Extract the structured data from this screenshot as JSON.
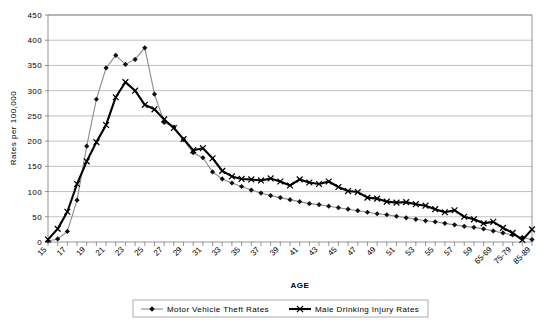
{
  "chart_data": {
    "type": "line",
    "title": "",
    "xlabel": "AGE",
    "ylabel": "Rates  per  100,000",
    "ylim": [
      0,
      450
    ],
    "ytick_step": 50,
    "yticks": [
      0,
      50,
      100,
      150,
      200,
      250,
      300,
      350,
      400,
      450
    ],
    "grid": true,
    "legend_position": "bottom",
    "categories": [
      "15",
      "16",
      "17",
      "18",
      "19",
      "20",
      "21",
      "22",
      "23",
      "24",
      "25",
      "26",
      "27",
      "28",
      "29",
      "30",
      "31",
      "32",
      "33",
      "34",
      "35",
      "36",
      "37",
      "38",
      "39",
      "40",
      "41",
      "42",
      "43",
      "44",
      "45",
      "46",
      "47",
      "48",
      "49",
      "50",
      "51",
      "52",
      "53",
      "54",
      "55",
      "56",
      "57",
      "58",
      "59",
      "60-64",
      "65-69",
      "70-74",
      "75-79",
      "80-84",
      "85-89"
    ],
    "tick_labels": [
      "15",
      "",
      "17",
      "",
      "19",
      "",
      "21",
      "",
      "23",
      "",
      "25",
      "",
      "27",
      "",
      "29",
      "",
      "31",
      "",
      "33",
      "",
      "35",
      "",
      "37",
      "",
      "39",
      "",
      "41",
      "",
      "43",
      "",
      "45",
      "",
      "47",
      "",
      "49",
      "",
      "51",
      "",
      "53",
      "",
      "55",
      "",
      "57",
      "",
      "59",
      "",
      "65-69",
      "",
      "75-79",
      "",
      "85-89"
    ],
    "series": [
      {
        "name": "Motor  Vehicle  Theft  Rates",
        "marker": "diamond",
        "color": "#8c8c8c",
        "values": [
          2,
          6,
          21,
          83,
          190,
          283,
          345,
          370,
          352,
          362,
          385,
          293,
          237,
          228,
          203,
          177,
          167,
          139,
          125,
          117,
          110,
          103,
          97,
          92,
          88,
          84,
          80,
          76,
          74,
          71,
          68,
          65,
          62,
          59,
          56,
          54,
          51,
          48,
          45,
          42,
          40,
          37,
          34,
          31,
          29,
          26,
          22,
          18,
          14,
          9,
          5
        ]
      },
      {
        "name": "Male  Drinking  Injury  Rates",
        "marker": "x",
        "color": "#000000",
        "values": [
          5,
          26,
          60,
          115,
          160,
          198,
          232,
          287,
          317,
          300,
          272,
          263,
          243,
          226,
          204,
          182,
          186,
          166,
          141,
          130,
          125,
          124,
          122,
          126,
          120,
          112,
          124,
          118,
          115,
          120,
          109,
          101,
          99,
          88,
          86,
          80,
          78,
          79,
          75,
          72,
          65,
          59,
          63,
          50,
          45,
          37,
          40,
          28,
          18,
          4,
          25
        ]
      }
    ]
  },
  "legend": {
    "items": [
      {
        "label": "Motor  Vehicle  Theft  Rates",
        "marker": "diamond"
      },
      {
        "label": "Male  Drinking  Injury  Rates",
        "marker": "x"
      }
    ]
  }
}
